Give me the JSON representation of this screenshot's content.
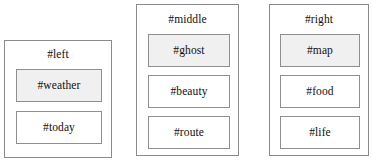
{
  "diagram": {
    "background_color": "#ffffff",
    "border_color": "#8a8a8a",
    "filled_box_color": "#f0f0f0",
    "plain_box_color": "#ffffff",
    "text_color": "#101010",
    "containers": [
      {
        "id": "left",
        "title": "#left",
        "children": [
          {
            "id": "weather",
            "label": "#weather",
            "fill": "filled"
          },
          {
            "id": "today",
            "label": "#today",
            "fill": "plain"
          }
        ]
      },
      {
        "id": "middle",
        "title": "#middle",
        "children": [
          {
            "id": "ghost",
            "label": "#ghost",
            "fill": "filled"
          },
          {
            "id": "beauty",
            "label": "#beauty",
            "fill": "plain"
          },
          {
            "id": "route",
            "label": "#route",
            "fill": "plain"
          }
        ]
      },
      {
        "id": "right",
        "title": "#right",
        "children": [
          {
            "id": "map",
            "label": "#map",
            "fill": "filled"
          },
          {
            "id": "food",
            "label": "#food",
            "fill": "plain"
          },
          {
            "id": "life",
            "label": "#life",
            "fill": "plain"
          }
        ]
      }
    ]
  }
}
